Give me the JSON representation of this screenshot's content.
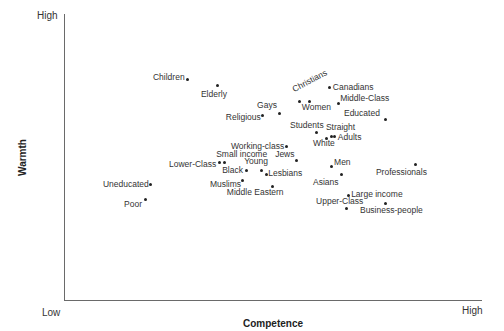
{
  "chart_data": {
    "type": "scatter",
    "title": "",
    "xlabel": "Competence",
    "ylabel": "Warmth",
    "x_tick_labels": [
      "Low",
      "High"
    ],
    "y_tick_labels": [
      "Low",
      "High"
    ],
    "xlim": [
      0,
      100
    ],
    "ylim": [
      0,
      100
    ],
    "grid": false,
    "legend": null,
    "points": [
      {
        "label": "Children",
        "x": 29.8,
        "y": 77.2,
        "lx": -35,
        "ly": -7
      },
      {
        "label": "Elderly",
        "x": 37.0,
        "y": 75.1,
        "lx": -17,
        "ly": 4
      },
      {
        "label": "Gays",
        "x": 51.7,
        "y": 65.6,
        "lx": -22,
        "ly": -12
      },
      {
        "label": "Religious",
        "x": 47.8,
        "y": 64.9,
        "lx": -37,
        "ly": -2
      },
      {
        "label": "Christians",
        "x": 56.5,
        "y": 69.8,
        "lx": -4,
        "ly": -16,
        "rotate": -28
      },
      {
        "label": "Canadians",
        "x": 63.9,
        "y": 74.4,
        "lx": 3,
        "ly": -5
      },
      {
        "label": "Women",
        "x": 59.1,
        "y": 69.8,
        "lx": -8,
        "ly": 2
      },
      {
        "label": "Middle-Class",
        "x": 65.9,
        "y": 68.8,
        "lx": 2,
        "ly": -10
      },
      {
        "label": "Educated",
        "x": 77.4,
        "y": 63.5,
        "lx": -42,
        "ly": -10
      },
      {
        "label": "Students",
        "x": 60.6,
        "y": 58.6,
        "lx": -26,
        "ly": -12
      },
      {
        "label": "Straight",
        "x": 64.4,
        "y": 57.5,
        "lx": -6,
        "ly": -13
      },
      {
        "label": "Adults",
        "x": 65.1,
        "y": 57.2,
        "lx": 3,
        "ly": -4
      },
      {
        "label": "White",
        "x": 63.0,
        "y": 56.8,
        "lx": -13,
        "ly": 1
      },
      {
        "label": "Working-class",
        "x": 53.6,
        "y": 53.7,
        "lx": -56,
        "ly": -5
      },
      {
        "label": "Jews",
        "x": 55.8,
        "y": 49.1,
        "lx": -21,
        "ly": -10
      },
      {
        "label": "Small income",
        "x": 37.3,
        "y": 48.4,
        "lx": -3,
        "ly": -12
      },
      {
        "label": "Lower-Class",
        "x": 38.7,
        "y": 48.4,
        "lx": -56,
        "ly": -2
      },
      {
        "label": "Young",
        "x": 47.4,
        "y": 45.6,
        "lx": -17,
        "ly": -13
      },
      {
        "label": "Black",
        "x": 43.8,
        "y": 45.3,
        "lx": -24,
        "ly": -5
      },
      {
        "label": "Lesbians",
        "x": 48.6,
        "y": 44.2,
        "lx": 2,
        "ly": -5
      },
      {
        "label": "Muslims",
        "x": 43.0,
        "y": 41.8,
        "lx": -33,
        "ly": -1
      },
      {
        "label": "Middle Eastern",
        "x": 50.2,
        "y": 40.0,
        "lx": -46,
        "ly": 2
      },
      {
        "label": "Uneducated",
        "x": 20.9,
        "y": 40.4,
        "lx": -48,
        "ly": -5
      },
      {
        "label": "Poor",
        "x": 19.5,
        "y": 35.1,
        "lx": -21,
        "ly": 0
      },
      {
        "label": "Men",
        "x": 64.2,
        "y": 46.7,
        "lx": 3,
        "ly": -9
      },
      {
        "label": "Asians",
        "x": 66.6,
        "y": 43.9,
        "lx": -28,
        "ly": 3
      },
      {
        "label": "Professionals",
        "x": 84.6,
        "y": 47.4,
        "lx": -40,
        "ly": 3
      },
      {
        "label": "Large income",
        "x": 68.3,
        "y": 36.8,
        "lx": 3,
        "ly": -5
      },
      {
        "label": "Upper-Class",
        "x": 67.8,
        "y": 32.1,
        "lx": -30,
        "ly": -12
      },
      {
        "label": "Business-people",
        "x": 77.4,
        "y": 33.7,
        "lx": -26,
        "ly": 2
      }
    ]
  }
}
